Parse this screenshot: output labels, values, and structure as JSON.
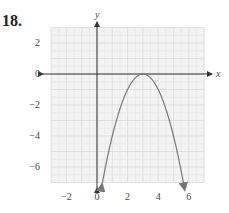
{
  "problem_number": "18.",
  "chart_data": {
    "type": "line",
    "title": "",
    "xlabel": "x",
    "ylabel": "y",
    "xlim": [
      -3,
      7
    ],
    "ylim": [
      -7,
      3
    ],
    "grid": true,
    "x_ticks": [
      -2,
      0,
      2,
      4,
      6
    ],
    "y_ticks": [
      2,
      0,
      -2,
      -4,
      -6
    ],
    "series": [
      {
        "name": "parabola",
        "equation": "y = -(x - 3)^2",
        "vertex": [
          3,
          0
        ],
        "x": [
          0.3,
          1,
          2,
          3,
          4,
          5,
          5.7
        ],
        "y": [
          -7.29,
          -4,
          -1,
          0,
          -1,
          -4,
          -7.29
        ],
        "arrows_at_ends": true,
        "color": "#777777"
      }
    ]
  }
}
